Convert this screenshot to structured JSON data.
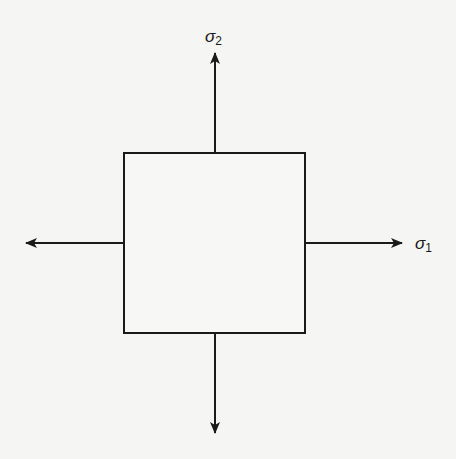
{
  "diagram": {
    "type": "biaxial-stress-element",
    "background": "#f5f5f3",
    "stroke_color": "#1a1a1a",
    "element": {
      "shape": "square",
      "x": 124,
      "y": 153,
      "width": 181,
      "height": 180
    },
    "arrows": [
      {
        "name": "arrow-up",
        "from": [
          215,
          153
        ],
        "to": [
          215,
          53
        ]
      },
      {
        "name": "arrow-down",
        "from": [
          215,
          333
        ],
        "to": [
          215,
          433
        ]
      },
      {
        "name": "arrow-left",
        "from": [
          124,
          243
        ],
        "to": [
          26,
          243
        ]
      },
      {
        "name": "arrow-right",
        "from": [
          305,
          243
        ],
        "to": [
          402,
          243
        ]
      }
    ],
    "labels": {
      "sigma2": {
        "symbol": "σ",
        "subscript": "2"
      },
      "sigma1": {
        "symbol": "σ",
        "subscript": "1"
      }
    }
  }
}
